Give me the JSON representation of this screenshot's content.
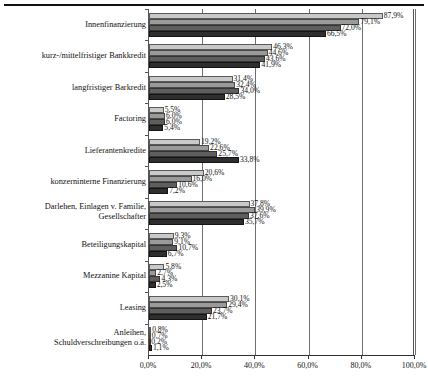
{
  "chart_data": {
    "type": "bar",
    "orientation": "horizontal",
    "title": "",
    "xlabel": "",
    "ylabel": "",
    "xlim": [
      0,
      100
    ],
    "grid": true,
    "legend": "none",
    "xticks": [
      "0,0%",
      "20,0%",
      "40,0%",
      "60,0%",
      "80,0%",
      "100,0%"
    ],
    "xtick_values": [
      0,
      20,
      40,
      60,
      80,
      100
    ],
    "categories": [
      "Innenfinanzierung",
      "kurz-/mittelfristiger Bankkredit",
      "langfristiger Barkredit",
      "Factoring",
      "Lieferantenkredite",
      "konzerninterne Finanzierung",
      "Darlehen, Einlagen v. Familie,\nGesellschafter",
      "Beteiligungskapital",
      "Mezzanine Kapital",
      "Leasing",
      "Anleihen,\nSchuldverschreibungen o.ä."
    ],
    "series": [
      {
        "name": "series-1",
        "color": "#c9c9c9",
        "values": [
          87.9,
          46.3,
          31.4,
          5.5,
          19.2,
          20.6,
          37.8,
          9.3,
          5.8,
          30.1,
          0.8
        ],
        "labels": [
          "87,9%",
          "46,3%",
          "31,4%",
          "5,5%",
          "19,2%",
          "20,6%",
          "37,8%",
          "9,3%",
          "5,8%",
          "30,1%",
          "0,8%"
        ]
      },
      {
        "name": "series-2",
        "color": "#9a9a9a",
        "values": [
          79.1,
          44.6,
          32.4,
          6.0,
          22.6,
          16.0,
          39.9,
          9.1,
          2.7,
          29.4,
          0.7
        ],
        "labels": [
          "79,1%",
          "44,6%",
          "32,4%",
          "6,0%",
          "22,6%",
          "16,0%",
          "39,9%",
          "9,1%",
          "2,7%",
          "29,4%",
          "0,7%"
        ]
      },
      {
        "name": "series-3",
        "color": "#5e5e5e",
        "values": [
          72.0,
          43.6,
          34.0,
          6.0,
          25.7,
          10.6,
          37.6,
          10.7,
          4.3,
          23.7,
          0.2
        ],
        "labels": [
          "72,0%",
          "43,6%",
          "34,0%",
          "6,0%",
          "25,7%",
          "10,6%",
          "37,6%",
          "10,7%",
          "4,3%",
          "23,7%",
          "0,2%"
        ]
      },
      {
        "name": "series-4",
        "color": "#2e2e2e",
        "values": [
          66.5,
          41.9,
          28.5,
          5.4,
          33.8,
          7.2,
          35.7,
          6.7,
          2.5,
          21.7,
          1.1
        ],
        "labels": [
          "66,5%",
          "41,9%",
          "28,5%",
          "5,4%",
          "33,8%",
          "7,2%",
          "35,7%",
          "6,7%",
          "2,5%",
          "21,7%",
          "1,1%"
        ]
      }
    ]
  }
}
